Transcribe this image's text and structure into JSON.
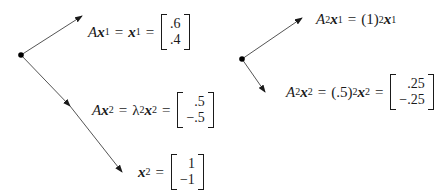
{
  "left_diagram": {
    "eq1": {
      "A": "A",
      "x": "x",
      "sub": "1",
      "eq": "=",
      "x2": "x",
      "sub2": "1",
      "eq2": "=",
      "vector": [
        ".6",
        ".4"
      ]
    },
    "eq2": {
      "A": "A",
      "x": "x",
      "sub": "2",
      "eq": "=",
      "lambda": "λ",
      "lsub": "2",
      "x2": "x",
      "sub2": "2",
      "eq2": "=",
      "vector": [
        ".5",
        "−.5"
      ]
    },
    "eq3": {
      "x": "x",
      "sub": "2",
      "eq": "=",
      "vector": [
        "1",
        "−1"
      ]
    }
  },
  "right_diagram": {
    "eq1": {
      "A": "A",
      "pow": "2",
      "x": "x",
      "sub": "1",
      "eq": "=",
      "coef": "(1)",
      "cpow": "2",
      "x2": "x",
      "sub2": "1"
    },
    "eq2": {
      "A": "A",
      "pow": "2",
      "x": "x",
      "sub": "2",
      "eq": "=",
      "coef": "(.5)",
      "cpow": "2",
      "x2": "x",
      "sub2": "2",
      "eq2": "=",
      "vector": [
        ".25",
        "−.25"
      ]
    }
  },
  "colors": {
    "line": "#555555",
    "ink": "#1a1a1a"
  }
}
